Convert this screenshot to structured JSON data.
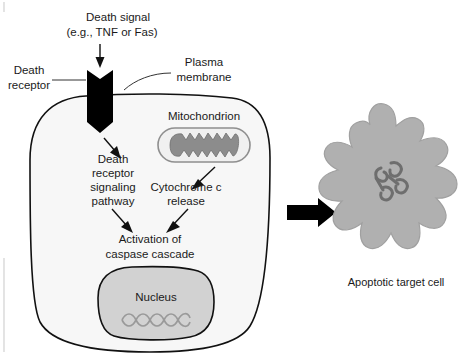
{
  "figure": {
    "title_caption": "Apoptotic target cell",
    "labels": {
      "death_signal_line1": "Death signal",
      "death_signal_line2": "(e.g., TNF or Fas)",
      "death_receptor_line1": "Death",
      "death_receptor_line2": "receptor",
      "plasma_membrane_line1": "Plasma",
      "plasma_membrane_line2": "membrane",
      "mitochondrion": "Mitochondrion",
      "pathway_line1": "Death",
      "pathway_line2": "receptor",
      "pathway_line3": "signaling",
      "pathway_line4": "pathway",
      "cytochrome_line1": "Cytochrome c",
      "cytochrome_line2": "release",
      "caspase_line1": "Activation of",
      "caspase_line2": "caspase cascade",
      "nucleus": "Nucleus",
      "apoptotic_cell": "Apoptotic target cell"
    },
    "colors": {
      "background": "#ffffff",
      "outline": "#111111",
      "cell_fill": "#f7f7f7",
      "nucleus_fill": "#d2d2d2",
      "mitochondrion_fill": "#f0f0f0",
      "cristae_fill": "#8c8c8c",
      "apoptotic_fill": "#b0b0b0",
      "chromatin": "#6e6e6e",
      "dna": "#9a9a9a",
      "receptor_black": "#000000",
      "frame_line": "#d8d8d8"
    },
    "icons": {
      "death_signal_arrow": "down-arrow-icon",
      "death_receptor": "receptor-chevron-icon",
      "pathway_arrow": "down-arrow-icon",
      "cytochrome_arrow": "diagonal-arrow-icon",
      "caspase_arrow_left": "diagonal-arrow-icon",
      "caspase_arrow_right": "diagonal-arrow-icon",
      "transition_arrow": "block-right-arrow-icon",
      "dna_strand": "dna-helix-icon",
      "chromatin_clump": "condensed-chromatin-icon"
    }
  }
}
